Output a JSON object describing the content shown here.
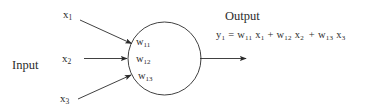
{
  "diagram": {
    "title_unrendered": "",
    "background_color": "#ffffff",
    "stroke_color": "#2b2b2b",
    "text_color": "#2b2b2b",
    "input_group_label": "Input",
    "output_group_label": "Output",
    "inputs": [
      {
        "name": "x1",
        "base": "x",
        "sub": "1"
      },
      {
        "name": "x2",
        "base": "x",
        "sub": "2"
      },
      {
        "name": "x3",
        "base": "x",
        "sub": "3"
      }
    ],
    "weights": [
      {
        "name": "w11",
        "base": "w",
        "sub": "11"
      },
      {
        "name": "w12",
        "base": "w",
        "sub": "12"
      },
      {
        "name": "w13",
        "base": "w",
        "sub": "13"
      }
    ],
    "output": {
      "base": "y",
      "sub": "1",
      "equals": "=",
      "plus": "+",
      "terms": [
        {
          "w_base": "w",
          "w_sub": "11",
          "x_base": "x",
          "x_sub": "1"
        },
        {
          "w_base": "w",
          "w_sub": "12",
          "x_base": "x",
          "x_sub": "2"
        },
        {
          "w_base": "w",
          "w_sub": "13",
          "x_base": "x",
          "x_sub": "3"
        }
      ],
      "plain_text": "y1 = w11 x1 + w12 x2 + w13 x3"
    }
  }
}
